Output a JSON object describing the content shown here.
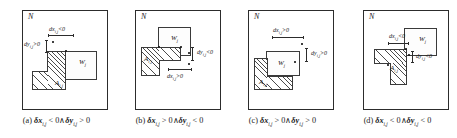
{
  "figure": {
    "region_label": "N",
    "box_w_label": "W",
    "box_w_sub": "j",
    "box_a_label": "A",
    "box_a_sub": "i,j"
  },
  "panels": [
    {
      "id": "a",
      "region_label": "N",
      "caption_index": "(a)",
      "caption_dx": "δx",
      "caption_dx_sub": "i,j",
      "caption_dx_rel": "< 0",
      "caption_and": "∧",
      "caption_dy": "δy",
      "caption_dy_sub": "i,j",
      "caption_dy_rel": "> 0",
      "box_w": "W",
      "box_w_sub": "j",
      "box_a": "A",
      "box_a_sub": "i,j",
      "annot_dx": "dx",
      "annot_dx_sub": "i,j",
      "annot_dx_rel": "<0",
      "annot_dy": "dy",
      "annot_dy_sub": "i,j",
      "annot_dy_rel": ">0"
    },
    {
      "id": "b",
      "region_label": "N",
      "caption_index": "(b)",
      "caption_dx": "δx",
      "caption_dx_sub": "i,j",
      "caption_dx_rel": "> 0",
      "caption_and": "∧",
      "caption_dy": "δy",
      "caption_dy_sub": "i,j",
      "caption_dy_rel": "< 0",
      "box_w": "W",
      "box_w_sub": "j",
      "box_a": "A",
      "box_a_sub": "i,j",
      "annot_dx": "dx",
      "annot_dx_sub": "i,j",
      "annot_dx_rel": ">0",
      "annot_dy": "dy",
      "annot_dy_sub": "i,j",
      "annot_dy_rel": "<0"
    },
    {
      "id": "c",
      "region_label": "N",
      "caption_index": "(c)",
      "caption_dx": "δx",
      "caption_dx_sub": "i,j",
      "caption_dx_rel": "> 0",
      "caption_and": "∧",
      "caption_dy": "δy",
      "caption_dy_sub": "i,j",
      "caption_dy_rel": "> 0",
      "box_w": "W",
      "box_w_sub": "j",
      "box_a": "A",
      "box_a_sub": "i,j",
      "annot_dx": "dx",
      "annot_dx_sub": "i,j",
      "annot_dx_rel": ">0",
      "annot_dy": "dy",
      "annot_dy_sub": "i,j",
      "annot_dy_rel": ">0"
    },
    {
      "id": "d",
      "region_label": "N",
      "caption_index": "(d)",
      "caption_dx": "δx",
      "caption_dx_sub": "i,j",
      "caption_dx_rel": "< 0",
      "caption_and": "∧",
      "caption_dy": "δy",
      "caption_dy_sub": "i,j",
      "caption_dy_rel": "< 0",
      "box_w": "W",
      "box_w_sub": "j",
      "box_a": "A",
      "box_a_sub": "i,j",
      "annot_dx": "dx",
      "annot_dx_sub": "i,j",
      "annot_dx_rel": "<0",
      "annot_dy": "dy",
      "annot_dy_sub": "i,j",
      "annot_dy_rel": "<0"
    }
  ],
  "colors": {
    "line": "#2c2c2c",
    "hatch": "#4a4a4a",
    "background": "#ffffff"
  }
}
